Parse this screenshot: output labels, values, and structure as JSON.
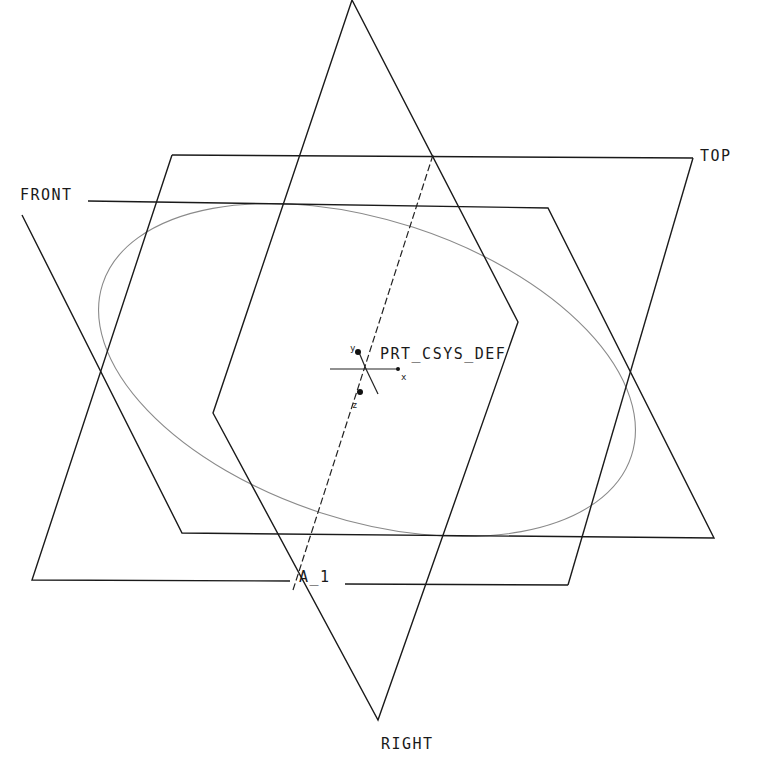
{
  "view": {
    "title": "Datum Planes View",
    "background": "#ffffff",
    "line_color": "#1a1a1a",
    "curve_color": "#8a8a8a"
  },
  "labels": {
    "top": "TOP",
    "front": "FRONT",
    "right": "RIGHT",
    "axis": "A_1",
    "csys": "PRT_CSYS_DEF",
    "csys_x": "x",
    "csys_y": "y",
    "csys_z": "z"
  },
  "datum_planes": [
    {
      "name": "TOP",
      "points": [
        [
          172,
          155
        ],
        [
          693,
          158
        ],
        [
          568,
          585
        ],
        [
          32,
          580
        ]
      ]
    },
    {
      "name": "FRONT",
      "points": [
        [
          88,
          201
        ],
        [
          548,
          208
        ],
        [
          714,
          538
        ],
        [
          182,
          533
        ]
      ]
    },
    {
      "name": "RIGHT",
      "points": [
        [
          352,
          0
        ],
        [
          518,
          322
        ],
        [
          378,
          720
        ],
        [
          213,
          413
        ]
      ]
    }
  ],
  "datum_axis": {
    "name": "A_1",
    "from": [
      433,
      155
    ],
    "to": [
      293,
      590
    ]
  },
  "sketch_curve": {
    "type": "ellipse",
    "cx": 367,
    "cy": 370,
    "rx": 278,
    "ry": 150,
    "rotation": 18
  }
}
